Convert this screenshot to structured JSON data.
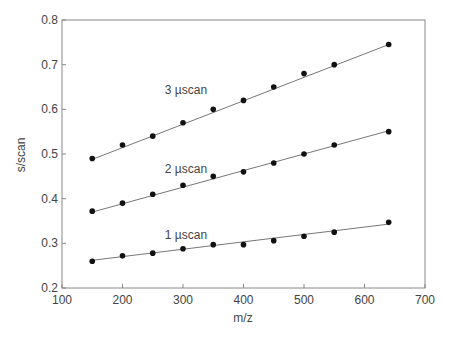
{
  "chart_data": {
    "type": "scatter",
    "title": "",
    "xlabel": "m/z",
    "ylabel": "s/scan",
    "xlim": [
      100,
      700
    ],
    "ylim": [
      0.2,
      0.8
    ],
    "xticks": [
      100,
      200,
      300,
      400,
      500,
      600,
      700
    ],
    "yticks": [
      0.2,
      0.3,
      0.4,
      0.5,
      0.6,
      0.7,
      0.8
    ],
    "ytick_labels": [
      "0.2",
      "0.3",
      "0.4",
      "0.5",
      "0.6",
      "0.7",
      "0.8"
    ],
    "grid": false,
    "legend": "none (inline annotations)",
    "x": [
      150,
      200,
      250,
      300,
      350,
      400,
      450,
      500,
      550,
      640
    ],
    "series": [
      {
        "name": "3 µscan",
        "values": [
          0.49,
          0.52,
          0.54,
          0.57,
          0.6,
          0.62,
          0.65,
          0.68,
          0.7,
          0.745
        ],
        "fit": [
          0.488,
          0.745
        ],
        "label_pos": [
          270,
          0.635
        ]
      },
      {
        "name": "2 µscan",
        "values": [
          0.372,
          0.39,
          0.41,
          0.43,
          0.45,
          0.46,
          0.48,
          0.5,
          0.52,
          0.55
        ],
        "fit": [
          0.37,
          0.552
        ],
        "label_pos": [
          270,
          0.458
        ]
      },
      {
        "name": "1 µscan",
        "values": [
          0.26,
          0.272,
          0.278,
          0.288,
          0.297,
          0.297,
          0.306,
          0.316,
          0.325,
          0.347
        ],
        "fit": [
          0.262,
          0.343
        ],
        "label_pos": [
          270,
          0.31
        ]
      }
    ]
  }
}
